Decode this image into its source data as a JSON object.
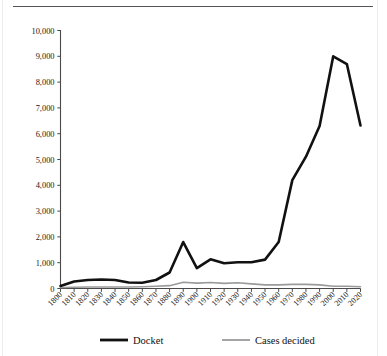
{
  "figure": {
    "background_color": "#ffffff",
    "rule_color": "#54545a",
    "has_top_rule": true,
    "has_side_borders": true
  },
  "chart_data": {
    "type": "line",
    "title": "",
    "subtitle": "",
    "xlabel": "",
    "ylabel": "",
    "grid": false,
    "legend_position": "bottom",
    "xlim": [
      1800,
      2020
    ],
    "ylim": [
      0,
      10000
    ],
    "ytick_labels": [
      "0",
      "1,000",
      "2,000",
      "3,000",
      "4,000",
      "5,000",
      "6,000",
      "7,000",
      "8,000",
      "9,000",
      "10,000"
    ],
    "ytick_values": [
      0,
      1000,
      2000,
      3000,
      4000,
      5000,
      6000,
      7000,
      8000,
      9000,
      10000
    ],
    "categories": [
      "1800",
      "1810",
      "1820",
      "1830",
      "1840",
      "1850",
      "1860",
      "1870",
      "1880",
      "1890",
      "1900",
      "1910",
      "1920",
      "1930",
      "1940",
      "1950",
      "1960",
      "1970",
      "1980",
      "1990",
      "2000",
      "2010",
      "2020"
    ],
    "x": [
      1800,
      1810,
      1820,
      1830,
      1840,
      1850,
      1860,
      1870,
      1880,
      1890,
      1900,
      1910,
      1920,
      1930,
      1940,
      1950,
      1960,
      1970,
      1980,
      1990,
      2000,
      2010,
      2020
    ],
    "series": [
      {
        "name": "Docket",
        "color": "#111111",
        "line_width": 2.6,
        "values": [
          100,
          270,
          330,
          350,
          330,
          230,
          220,
          330,
          620,
          1800,
          790,
          1130,
          980,
          1020,
          1020,
          1120,
          1800,
          4200,
          5110,
          6300,
          9000,
          8700,
          6320
        ]
      },
      {
        "name": "Cases decided",
        "color": "#9a9a9a",
        "line_width": 1.6,
        "values": [
          40,
          50,
          60,
          60,
          60,
          60,
          70,
          90,
          110,
          240,
          210,
          230,
          200,
          220,
          180,
          140,
          140,
          160,
          160,
          140,
          90,
          90,
          70
        ]
      }
    ],
    "legend": [
      {
        "label": "Docket",
        "color": "#111111",
        "line_width": 2.8
      },
      {
        "label": "Cases decided",
        "color": "#9a9a9a",
        "line_width": 1.8
      }
    ]
  }
}
